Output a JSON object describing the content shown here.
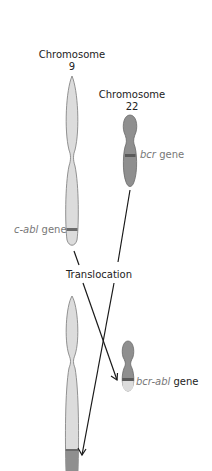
{
  "labels": {
    "chr9_title": "Chromosome",
    "chr9_number": "9",
    "chr22_title": "Chromosome",
    "chr22_number": "22",
    "bcr_italic": "bcr",
    "bcr_suffix": " gene",
    "cabl_italic": "c-abl",
    "cabl_suffix": " gene",
    "translocation": "Translocation",
    "fusion_italic": "bcr-abl",
    "fusion_suffix": " gene"
  },
  "colors": {
    "chr9_fill": "#dcdcdc",
    "chr22_fill": "#8f8f8f",
    "outline": "#7a7a7a",
    "band": "#6b6b6b",
    "arrow": "#1a1a1a",
    "gene_label": "#777777"
  }
}
